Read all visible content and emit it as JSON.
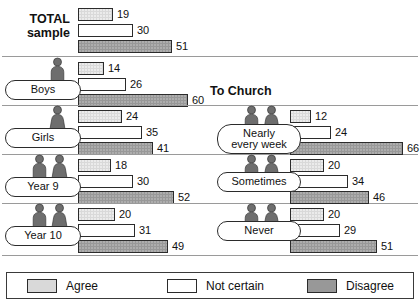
{
  "chart_data": {
    "type": "bar",
    "title": "",
    "orientation": "horizontal",
    "legend": {
      "position": "bottom",
      "entries": [
        {
          "label": "Agree",
          "color": "#d9d9d9",
          "key": "agree"
        },
        {
          "label": "Not certain",
          "color": "#ffffff",
          "key": "not_certain"
        },
        {
          "label": "Disagree",
          "color": "#989898",
          "key": "disagree"
        }
      ]
    },
    "series": [
      {
        "name": "Agree",
        "values": [
          19,
          14,
          24,
          18,
          20,
          12,
          20,
          20
        ]
      },
      {
        "name": "Not certain",
        "values": [
          30,
          26,
          35,
          30,
          31,
          24,
          34,
          29
        ]
      },
      {
        "name": "Disagree",
        "values": [
          51,
          60,
          41,
          52,
          49,
          66,
          46,
          51
        ]
      }
    ],
    "categories": [
      "TOTAL sample",
      "Boys",
      "Girls",
      "Year 9",
      "Year 10",
      "Nearly every week",
      "Sometimes",
      "Never"
    ],
    "xlabel": "",
    "ylabel": "",
    "grid": false,
    "xlim": [
      0,
      70
    ],
    "units": "percent"
  },
  "headings": {
    "total_line1": "TOTAL",
    "total_line2": "sample",
    "to_church": "To Church"
  },
  "left_groups": [
    {
      "label": "Boys",
      "icons": [
        "male-figure-icon"
      ],
      "bars": [
        {
          "key": "agree",
          "value": "14"
        },
        {
          "key": "not_certain",
          "value": "26"
        },
        {
          "key": "disagree",
          "value": "60"
        }
      ]
    },
    {
      "label": "Girls",
      "icons": [
        "female-figure-icon"
      ],
      "bars": [
        {
          "key": "agree",
          "value": "24"
        },
        {
          "key": "not_certain",
          "value": "35"
        },
        {
          "key": "disagree",
          "value": "41"
        }
      ]
    },
    {
      "label": "Year 9",
      "icons": [
        "male-figure-icon",
        "female-figure-icon"
      ],
      "bars": [
        {
          "key": "agree",
          "value": "18"
        },
        {
          "key": "not_certain",
          "value": "30"
        },
        {
          "key": "disagree",
          "value": "52"
        }
      ]
    },
    {
      "label": "Year 10",
      "icons": [
        "male-figure-icon",
        "female-figure-icon"
      ],
      "bars": [
        {
          "key": "agree",
          "value": "20"
        },
        {
          "key": "not_certain",
          "value": "31"
        },
        {
          "key": "disagree",
          "value": "49"
        }
      ]
    }
  ],
  "total_bars": [
    {
      "key": "agree",
      "value": "19"
    },
    {
      "key": "not_certain",
      "value": "30"
    },
    {
      "key": "disagree",
      "value": "51"
    }
  ],
  "right_groups": [
    {
      "label_line1": "Nearly",
      "label_line2": "every week",
      "icons": [
        "male-figure-icon",
        "female-figure-icon"
      ],
      "bars": [
        {
          "key": "agree",
          "value": "12"
        },
        {
          "key": "not_certain",
          "value": "24"
        },
        {
          "key": "disagree",
          "value": "66"
        }
      ]
    },
    {
      "label_line1": "Sometimes",
      "label_line2": "",
      "icons": [
        "male-figure-icon",
        "female-figure-icon"
      ],
      "bars": [
        {
          "key": "agree",
          "value": "20"
        },
        {
          "key": "not_certain",
          "value": "34"
        },
        {
          "key": "disagree",
          "value": "46"
        }
      ]
    },
    {
      "label_line1": "Never",
      "label_line2": "",
      "icons": [
        "male-figure-icon",
        "female-figure-icon"
      ],
      "bars": [
        {
          "key": "agree",
          "value": "20"
        },
        {
          "key": "not_certain",
          "value": "29"
        },
        {
          "key": "disagree",
          "value": "51"
        }
      ]
    }
  ],
  "legend": [
    {
      "label": "Agree",
      "key": "agree"
    },
    {
      "label": "Not certain",
      "key": "not_certain"
    },
    {
      "label": "Disagree",
      "key": "disagree"
    }
  ]
}
